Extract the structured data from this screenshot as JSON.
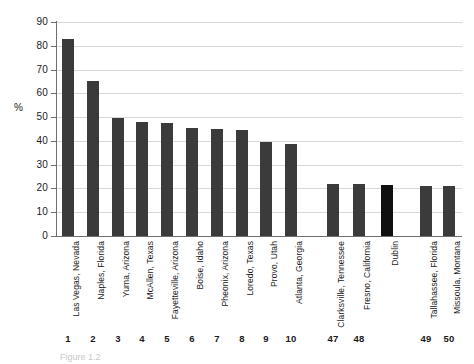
{
  "chart_data": {
    "type": "bar",
    "title": "",
    "subtitle": "",
    "xlabel": "",
    "ylabel": "%",
    "ylim": [
      0,
      90
    ],
    "ytick_step": 10,
    "yticks": [
      "0",
      "10",
      "20",
      "30",
      "40",
      "50",
      "60",
      "70",
      "80",
      "90"
    ],
    "grid": true,
    "legend": "none",
    "categories": [
      "Las Vegas, Nevada",
      "Naples, Florida",
      "Yuma, Arizona",
      "McAllen, Texas",
      "Fayetteville, Arizona",
      "Boise, Idaho",
      "Pheonix, Arizona",
      "Loredo, Texas",
      "Provo, Utah",
      "Atlanta, Georgia",
      "Clarksville, Tennessee",
      "Fresno, California",
      "Dublin",
      "Tallahassee, Florida",
      "Missoula, Montana"
    ],
    "rank_labels": [
      "1",
      "2",
      "3",
      "4",
      "5",
      "6",
      "7",
      "8",
      "9",
      "10",
      "47",
      "48",
      "",
      "49",
      "50"
    ],
    "values": [
      83,
      65,
      49.5,
      48,
      47.5,
      45.5,
      45,
      44.5,
      39.5,
      38.5,
      21.8,
      21.8,
      21.5,
      21,
      21
    ],
    "highlight_index": 12,
    "colors": {
      "bar": "#3b3b3b",
      "bar_highlight": "#101010",
      "gridline": "#d8d8d8",
      "axis": "#6f6f6f",
      "text": "#1a1a1a",
      "background": "#ffffff"
    }
  },
  "caption": {
    "text": "Figure 1.2"
  }
}
